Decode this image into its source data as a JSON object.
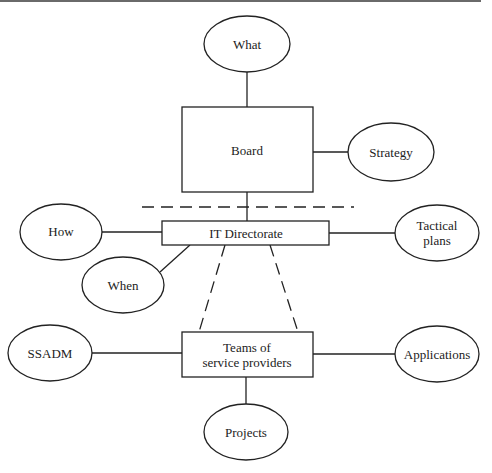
{
  "diagram": {
    "type": "organisational-hierarchy",
    "nodes": {
      "what": {
        "label": "What",
        "shape": "ellipse"
      },
      "board": {
        "label": "Board",
        "shape": "rectangle"
      },
      "strategy": {
        "label": "Strategy",
        "shape": "ellipse"
      },
      "how": {
        "label": "How",
        "shape": "ellipse"
      },
      "it_directorate": {
        "label": "IT Directorate",
        "shape": "rectangle"
      },
      "tactical_plans": {
        "label_line1": "Tactical",
        "label_line2": "plans",
        "shape": "ellipse"
      },
      "when": {
        "label": "When",
        "shape": "ellipse"
      },
      "ssadm": {
        "label": "SSADM",
        "shape": "ellipse"
      },
      "teams": {
        "label_line1": "Teams of",
        "label_line2": "service providers",
        "shape": "rectangle"
      },
      "applications": {
        "label": "Applications",
        "shape": "ellipse"
      },
      "projects": {
        "label": "Projects",
        "shape": "ellipse"
      }
    },
    "edges": [
      {
        "from": "what",
        "to": "board",
        "style": "solid"
      },
      {
        "from": "board",
        "to": "strategy",
        "style": "solid"
      },
      {
        "from": "board",
        "to": "it_directorate",
        "style": "solid"
      },
      {
        "from": "how",
        "to": "it_directorate",
        "style": "solid"
      },
      {
        "from": "it_directorate",
        "to": "tactical_plans",
        "style": "solid"
      },
      {
        "from": "it_directorate",
        "to": "when",
        "style": "solid"
      },
      {
        "from": "it_directorate",
        "to": "teams",
        "style": "dashed"
      },
      {
        "from": "it_directorate",
        "to": "teams",
        "style": "dashed"
      },
      {
        "from": "ssadm",
        "to": "teams",
        "style": "solid"
      },
      {
        "from": "teams",
        "to": "applications",
        "style": "solid"
      },
      {
        "from": "teams",
        "to": "projects",
        "style": "solid"
      }
    ],
    "separator": {
      "style": "dashed",
      "position": "between board and IT Directorate"
    }
  }
}
